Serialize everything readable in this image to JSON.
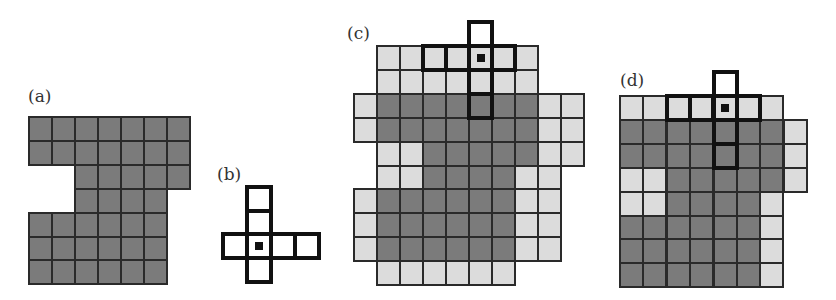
{
  "figure": {
    "colors": {
      "foreground_dark": "#7b7b7b",
      "background_light": "#dcdcdc",
      "grid_line": "#2a2a2a",
      "element_outline": "#111111"
    },
    "panels": [
      {
        "id": "a",
        "label": "(a)",
        "description": "Original binary image (foreground set A)",
        "origin": [
          28,
          116
        ],
        "cell": [
          23,
          23.9
        ],
        "label_pos": [
          28,
          88
        ],
        "cells": [
          {
            "row": 0,
            "cols": [
              0,
              1,
              2,
              3,
              4,
              5,
              6
            ],
            "type": "dark"
          },
          {
            "row": 1,
            "cols": [
              0,
              1,
              2,
              3,
              4,
              5,
              6
            ],
            "type": "dark"
          },
          {
            "row": 2,
            "cols": [
              2,
              3,
              4,
              5,
              6
            ],
            "type": "dark"
          },
          {
            "row": 3,
            "cols": [
              2,
              3,
              4,
              5
            ],
            "type": "dark"
          },
          {
            "row": 4,
            "cols": [
              0,
              1,
              2,
              3,
              4,
              5
            ],
            "type": "dark"
          },
          {
            "row": 5,
            "cols": [
              0,
              1,
              2,
              3,
              4,
              5
            ],
            "type": "dark"
          },
          {
            "row": 6,
            "cols": [
              0,
              1,
              2,
              3,
              4,
              5
            ],
            "type": "dark"
          }
        ]
      },
      {
        "id": "b",
        "label": "(b)",
        "description": "Structuring element B with origin marked",
        "origin": [
          222,
          186
        ],
        "cell": [
          24,
          23.5
        ],
        "label_pos": [
          217,
          166
        ],
        "structuring_element": {
          "cells": [
            [
              0,
              1
            ],
            [
              1,
              1
            ],
            [
              2,
              0
            ],
            [
              2,
              1
            ],
            [
              2,
              2
            ],
            [
              2,
              3
            ],
            [
              3,
              1
            ]
          ],
          "center": [
            2,
            1
          ]
        }
      },
      {
        "id": "c",
        "label": "(c)",
        "description": "Dilation of A by B (dark = A, light = added pixels)",
        "origin": [
          353,
          45
        ],
        "cell": [
          23,
          23.9
        ],
        "label_pos": [
          347,
          25
        ],
        "cells": [
          {
            "row": 0,
            "cols": [
              1,
              2,
              3,
              4,
              5,
              6,
              7
            ],
            "type": "light"
          },
          {
            "row": 1,
            "cols": [
              1,
              2,
              3,
              4,
              5,
              6,
              7
            ],
            "type": "light"
          },
          {
            "row": 2,
            "cols": [
              0
            ],
            "type": "light"
          },
          {
            "row": 2,
            "cols": [
              1,
              2,
              3,
              4,
              5,
              6,
              7
            ],
            "type": "dark"
          },
          {
            "row": 2,
            "cols": [
              8,
              9
            ],
            "type": "light"
          },
          {
            "row": 3,
            "cols": [
              0
            ],
            "type": "light"
          },
          {
            "row": 3,
            "cols": [
              1,
              2,
              3,
              4,
              5,
              6,
              7
            ],
            "type": "dark"
          },
          {
            "row": 3,
            "cols": [
              8,
              9
            ],
            "type": "light"
          },
          {
            "row": 4,
            "cols": [
              1,
              2
            ],
            "type": "light"
          },
          {
            "row": 4,
            "cols": [
              3,
              4,
              5,
              6,
              7
            ],
            "type": "dark"
          },
          {
            "row": 4,
            "cols": [
              8,
              9
            ],
            "type": "light"
          },
          {
            "row": 5,
            "cols": [
              1,
              2
            ],
            "type": "light"
          },
          {
            "row": 5,
            "cols": [
              3,
              4,
              5,
              6
            ],
            "type": "dark"
          },
          {
            "row": 5,
            "cols": [
              7,
              8
            ],
            "type": "light"
          },
          {
            "row": 6,
            "cols": [
              0
            ],
            "type": "light"
          },
          {
            "row": 6,
            "cols": [
              1,
              2,
              3,
              4,
              5,
              6
            ],
            "type": "dark"
          },
          {
            "row": 6,
            "cols": [
              7,
              8
            ],
            "type": "light"
          },
          {
            "row": 7,
            "cols": [
              0
            ],
            "type": "light"
          },
          {
            "row": 7,
            "cols": [
              1,
              2,
              3,
              4,
              5,
              6
            ],
            "type": "dark"
          },
          {
            "row": 7,
            "cols": [
              7,
              8
            ],
            "type": "light"
          },
          {
            "row": 8,
            "cols": [
              0
            ],
            "type": "light"
          },
          {
            "row": 8,
            "cols": [
              1,
              2,
              3,
              4,
              5,
              6
            ],
            "type": "dark"
          },
          {
            "row": 8,
            "cols": [
              7,
              8
            ],
            "type": "light"
          },
          {
            "row": 9,
            "cols": [
              1,
              2,
              3,
              4,
              5,
              6
            ],
            "type": "light"
          }
        ],
        "structuring_element_overlay": {
          "cells": [
            [
              -1,
              5
            ],
            [
              0,
              3
            ],
            [
              0,
              4
            ],
            [
              0,
              5
            ],
            [
              0,
              6
            ],
            [
              1,
              5
            ],
            [
              2,
              5
            ]
          ],
          "center": [
            0,
            5
          ]
        }
      },
      {
        "id": "d",
        "label": "(d)",
        "description": "Second dilation/closing result",
        "origin": [
          619,
          95
        ],
        "cell": [
          23.4,
          23.9
        ],
        "label_pos": [
          620,
          72
        ],
        "cells": [
          {
            "row": 0,
            "cols": [
              0,
              1,
              2,
              3,
              4,
              5,
              6
            ],
            "type": "light"
          },
          {
            "row": 1,
            "cols": [
              0,
              1,
              2,
              3,
              4,
              5,
              6
            ],
            "type": "dark"
          },
          {
            "row": 1,
            "cols": [
              7
            ],
            "type": "light"
          },
          {
            "row": 2,
            "cols": [
              0,
              1,
              2,
              3,
              4,
              5,
              6
            ],
            "type": "dark"
          },
          {
            "row": 2,
            "cols": [
              7
            ],
            "type": "light"
          },
          {
            "row": 3,
            "cols": [
              0,
              1
            ],
            "type": "light"
          },
          {
            "row": 3,
            "cols": [
              2,
              3,
              4,
              5,
              6
            ],
            "type": "dark"
          },
          {
            "row": 3,
            "cols": [
              7
            ],
            "type": "light"
          },
          {
            "row": 4,
            "cols": [
              0,
              1
            ],
            "type": "light"
          },
          {
            "row": 4,
            "cols": [
              2,
              3,
              4,
              5
            ],
            "type": "dark"
          },
          {
            "row": 4,
            "cols": [
              6
            ],
            "type": "light"
          },
          {
            "row": 5,
            "cols": [
              0,
              1,
              2,
              3,
              4,
              5
            ],
            "type": "dark"
          },
          {
            "row": 5,
            "cols": [
              6
            ],
            "type": "light"
          },
          {
            "row": 6,
            "cols": [
              0,
              1,
              2,
              3,
              4,
              5
            ],
            "type": "dark"
          },
          {
            "row": 6,
            "cols": [
              6
            ],
            "type": "light"
          },
          {
            "row": 7,
            "cols": [
              0,
              1,
              2,
              3,
              4,
              5
            ],
            "type": "dark"
          },
          {
            "row": 7,
            "cols": [
              6
            ],
            "type": "light"
          }
        ],
        "structuring_element_overlay": {
          "cells": [
            [
              -1,
              4
            ],
            [
              0,
              2
            ],
            [
              0,
              3
            ],
            [
              0,
              4
            ],
            [
              0,
              5
            ],
            [
              1,
              4
            ],
            [
              2,
              4
            ]
          ],
          "center": [
            0,
            4
          ]
        }
      }
    ]
  }
}
